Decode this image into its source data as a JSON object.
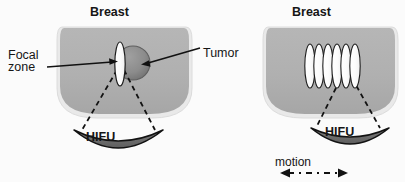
{
  "figure": {
    "type": "diagram",
    "background_color": "#fbfbfb",
    "panel_count": 2
  },
  "colors": {
    "background": "#fbfbfb",
    "tissue_fill": "#b0b0b0",
    "tissue_halo": "#e6e6e6",
    "tumor_fill": "#8c8c8c",
    "tumor_edge": "#5f5f5f",
    "focal_zone_fill": "#fdfdfd",
    "focal_zone_edge": "#1c1c1c",
    "transducer_fill": "#6e6e6e",
    "transducer_edge": "#121212",
    "line_color": "#111111",
    "text_color": "#161616"
  },
  "panels": [
    {
      "id": "left",
      "name": "single-focal-zone-panel",
      "title": "Breast",
      "labels": {
        "breast": "Breast",
        "focal_zone_line1": "Focal",
        "focal_zone_line2": "zone",
        "tumor": "Tumor",
        "hifu": "HIFU"
      },
      "focal_zone_count": 1,
      "has_tumor": true,
      "has_motion_arrow": false
    },
    {
      "id": "right",
      "name": "swept-focal-zones-panel",
      "title": "Breast",
      "labels": {
        "breast": "Breast",
        "hifu": "HIFU",
        "motion": "motion"
      },
      "focal_zone_count": 6,
      "has_tumor": false,
      "has_motion_arrow": true
    }
  ],
  "annotations": {
    "focal_zone": "Focal\nzone",
    "focal_zone_line1": "Focal",
    "focal_zone_line2": "zone",
    "tumor": "Tumor",
    "breast_left": "Breast",
    "breast_right": "Breast",
    "hifu_left": "HIFU",
    "hifu_right": "HIFU",
    "motion": "motion"
  },
  "icons": {
    "leader_line_focal": "leader-line-arrow-icon",
    "leader_line_tumor": "leader-line-arrow-icon",
    "beam_left": "dashed-beam-icon",
    "beam_right": "dashed-beam-icon",
    "motion_arrow": "double-headed-dash-dot-arrow-icon",
    "transducer": "concave-transducer-icon"
  }
}
